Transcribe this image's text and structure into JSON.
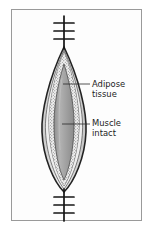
{
  "figure": {
    "background_color": "#ffffff",
    "frame": {
      "border_color": "#9a9a9a",
      "fill_color": "#fdfdfd"
    }
  },
  "labels": [
    {
      "id": "adipose",
      "line1": "Adipose",
      "line2": "tissue",
      "leader_from_x": 63,
      "leader_to_x": 90,
      "leader_y": 84
    },
    {
      "id": "muscle",
      "line1": "Muscle",
      "line2": "intact",
      "leader_from_x": 62,
      "leader_to_x": 90,
      "leader_y": 124
    }
  ],
  "illustration": {
    "midline_x": 64,
    "wound_top_y": 47,
    "wound_bottom_y": 190,
    "layers": [
      {
        "name": "skin-outer-edge",
        "color": "#2b2b2b",
        "description": "dark outer incision margin"
      },
      {
        "name": "dermis-light-band",
        "color": "#e8e8e8",
        "description": "pale band inside outer margin"
      },
      {
        "name": "adipose-stipple-band",
        "color": "#f2f2f2",
        "stipple_color": "#6a6a6a",
        "description": "stippled fatty tissue layer"
      },
      {
        "name": "muscle-body",
        "color": "#9c9c9c",
        "highlight_color": "#b8b8b8",
        "description": "intact muscle, medium grey oval"
      }
    ],
    "sutures": {
      "stroke_color": "#1a1a1a",
      "top_group": {
        "count": 3,
        "y_positions": [
          23,
          31,
          39
        ],
        "half_width": 10
      },
      "bottom_group": {
        "count": 3,
        "y_positions": [
          197,
          205,
          213
        ],
        "half_width": 10
      },
      "top_stem": {
        "from_y": 16,
        "to_y": 47
      },
      "bottom_stem": {
        "from_y": 190,
        "to_y": 221
      }
    }
  }
}
